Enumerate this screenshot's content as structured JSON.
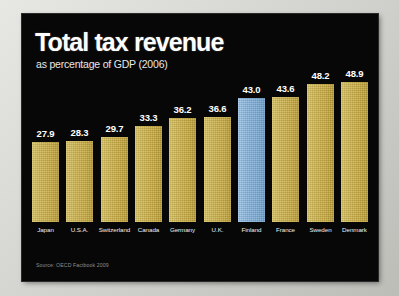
{
  "header": {
    "title": "Total tax revenue",
    "subtitle": "as percentage of GDP (2006)"
  },
  "footer": {
    "source": "Source: OECD Factbook 2009"
  },
  "colors": {
    "panel_background": "#070707",
    "frame_background": "#c9c9c6",
    "bar": "#c8ad47",
    "bar_highlight": "#7fb0da",
    "title_text": "#ffffff",
    "label_text": "#f0f0f0",
    "source_text": "#8e8e8e"
  },
  "chart_data": {
    "type": "bar",
    "title": "Total tax revenue",
    "subtitle": "as percentage of GDP (2006)",
    "xlabel": "",
    "ylabel": "",
    "ylim": [
      0,
      55
    ],
    "grid": false,
    "legend": "none",
    "highlight_category": "Finland",
    "categories": [
      "Japan",
      "U.S.A.",
      "Switzerland",
      "Canada",
      "Germany",
      "U.K.",
      "Finland",
      "France",
      "Sweden",
      "Denmark"
    ],
    "values": [
      27.9,
      28.3,
      29.7,
      33.3,
      36.2,
      36.6,
      43.0,
      43.6,
      48.2,
      48.9
    ],
    "value_labels": [
      "27.9",
      "28.3",
      "29.7",
      "33.3",
      "36.2",
      "36.6",
      "43.0",
      "43.6",
      "48.2",
      "48.9"
    ],
    "annotations": [
      "Source: OECD Factbook 2009"
    ]
  }
}
